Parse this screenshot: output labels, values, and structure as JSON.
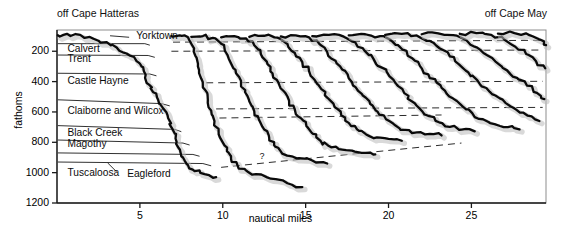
{
  "figure": {
    "site_left": "off Cape Hatteras",
    "site_right": "off Cape May"
  },
  "chart_data": {
    "type": "line",
    "title": "",
    "xlabel": "nautical miles",
    "ylabel": "fathoms",
    "xlim": [
      0,
      29.5
    ],
    "ylim": [
      1200,
      60
    ],
    "y_inverted": true,
    "grid": false,
    "xticks": [
      5,
      10,
      15,
      20,
      25
    ],
    "xtick_labels": [
      "5",
      "10",
      "15",
      "20",
      "25"
    ],
    "yticks": [
      200,
      400,
      600,
      800,
      1000,
      1200
    ],
    "ytick_labels": [
      "200",
      "400",
      "600",
      "800",
      "1000",
      "1200"
    ],
    "legend_position": "none",
    "annotations": [
      {
        "text": "off Cape Hatteras",
        "x": 0.2,
        "y": 40,
        "role": "site-left"
      },
      {
        "text": "off Cape May",
        "x": 27.5,
        "y": 40,
        "role": "site-right"
      },
      {
        "text": "?",
        "x": 12.4,
        "y": 905,
        "role": "uncertain-horizon-marker"
      }
    ],
    "stratigraphic_units": [
      {
        "name": "Yorktown",
        "label_x": 4.6,
        "label_y": 105,
        "top_fathoms": 90,
        "leader": true
      },
      {
        "name": "Calvert",
        "label_x": 0.45,
        "label_y": 195,
        "top_fathoms": 150
      },
      {
        "name": "Trent",
        "label_x": 0.45,
        "label_y": 255,
        "top_fathoms": 225
      },
      {
        "name": "Castle Hayne",
        "label_x": 0.45,
        "label_y": 400,
        "top_fathoms": 345
      },
      {
        "name": "Claiborne and Wilcox",
        "label_x": 0.45,
        "label_y": 600,
        "top_fathoms": 520
      },
      {
        "name": "Black Creek",
        "label_x": 0.45,
        "label_y": 745,
        "top_fathoms": 690
      },
      {
        "name": "Magothy",
        "label_x": 0.45,
        "label_y": 820,
        "top_fathoms": 785
      },
      {
        "name": "Tuscaloosa",
        "label_x": 0.45,
        "label_y": 1010,
        "top_fathoms": 870
      },
      {
        "name": "Eagleford",
        "label_x": 4.05,
        "label_y": 1015,
        "top_fathoms": 930,
        "leader": true
      }
    ],
    "horizon_dashed_lines": [
      {
        "name": "Yorktown base",
        "x_start": 7.0,
        "y_start": 140,
        "x_end": 29.3,
        "y_end": 128
      },
      {
        "name": "Calvert base",
        "x_start": 6.9,
        "y_start": 200,
        "x_end": 29.3,
        "y_end": 192
      },
      {
        "name": "Castle Hayne base",
        "x_start": 9.0,
        "y_start": 408,
        "x_end": 29.3,
        "y_end": 398
      },
      {
        "name": "Claiborne and Wilcox top",
        "x_start": 9.6,
        "y_start": 580,
        "x_end": 29.3,
        "y_end": 570
      },
      {
        "name": "Claiborne and Wilcox base",
        "x_start": 9.8,
        "y_start": 640,
        "x_end": 23.2,
        "y_end": 620
      },
      {
        "name": "uncertain deep horizon",
        "x_start": 9.9,
        "y_start": 965,
        "x_end": 24.4,
        "y_end": 805,
        "marker": "?"
      }
    ],
    "series": [
      {
        "name": "profile-trace-01",
        "points": [
          [
            0.05,
            95
          ],
          [
            0.6,
            85
          ],
          [
            1.4,
            92
          ],
          [
            2.2,
            118
          ],
          [
            3.0,
            140
          ],
          [
            3.6,
            175
          ],
          [
            4.2,
            215
          ],
          [
            4.8,
            265
          ],
          [
            5.1,
            300
          ],
          [
            5.35,
            355
          ],
          [
            5.55,
            420
          ],
          [
            5.8,
            470
          ],
          [
            6.1,
            520
          ],
          [
            6.4,
            575
          ],
          [
            6.7,
            640
          ],
          [
            6.95,
            710
          ],
          [
            7.15,
            775
          ],
          [
            7.35,
            840
          ],
          [
            7.6,
            900
          ],
          [
            7.9,
            950
          ],
          [
            8.3,
            990
          ],
          [
            8.9,
            1010
          ],
          [
            9.6,
            1030
          ]
        ]
      },
      {
        "name": "profile-trace-02",
        "points": [
          [
            6.9,
            100
          ],
          [
            7.4,
            95
          ],
          [
            7.9,
            108
          ],
          [
            8.15,
            160
          ],
          [
            8.35,
            230
          ],
          [
            8.5,
            300
          ],
          [
            8.7,
            380
          ],
          [
            8.9,
            450
          ],
          [
            9.1,
            520
          ],
          [
            9.3,
            590
          ],
          [
            9.5,
            660
          ],
          [
            9.75,
            730
          ],
          [
            10.0,
            800
          ],
          [
            10.25,
            860
          ],
          [
            10.5,
            910
          ],
          [
            10.9,
            955
          ],
          [
            11.4,
            985
          ],
          [
            12.0,
            1010
          ],
          [
            12.9,
            1040
          ],
          [
            13.9,
            1070
          ],
          [
            14.8,
            1095
          ]
        ]
      },
      {
        "name": "profile-trace-03",
        "points": [
          [
            8.1,
            105
          ],
          [
            8.8,
            100
          ],
          [
            9.4,
            112
          ],
          [
            9.9,
            150
          ],
          [
            10.2,
            210
          ],
          [
            10.5,
            280
          ],
          [
            10.8,
            345
          ],
          [
            11.1,
            410
          ],
          [
            11.35,
            470
          ],
          [
            11.6,
            530
          ],
          [
            11.9,
            595
          ],
          [
            12.2,
            655
          ],
          [
            12.5,
            715
          ],
          [
            12.8,
            770
          ],
          [
            13.1,
            820
          ],
          [
            13.5,
            860
          ],
          [
            14.0,
            890
          ],
          [
            14.6,
            905
          ],
          [
            15.4,
            920
          ],
          [
            16.3,
            940
          ]
        ]
      },
      {
        "name": "profile-trace-04",
        "points": [
          [
            9.9,
            108
          ],
          [
            10.7,
            100
          ],
          [
            11.4,
            115
          ],
          [
            11.9,
            160
          ],
          [
            12.3,
            220
          ],
          [
            12.7,
            285
          ],
          [
            13.0,
            345
          ],
          [
            13.35,
            405
          ],
          [
            13.7,
            465
          ],
          [
            14.0,
            525
          ],
          [
            14.35,
            585
          ],
          [
            14.7,
            640
          ],
          [
            15.05,
            695
          ],
          [
            15.45,
            745
          ],
          [
            15.9,
            790
          ],
          [
            16.4,
            825
          ],
          [
            17.0,
            845
          ],
          [
            17.8,
            855
          ],
          [
            18.6,
            870
          ],
          [
            19.2,
            880
          ]
        ]
      },
      {
        "name": "profile-trace-05",
        "points": [
          [
            11.6,
            105
          ],
          [
            12.5,
            98
          ],
          [
            13.3,
            110
          ],
          [
            13.9,
            152
          ],
          [
            14.35,
            212
          ],
          [
            14.8,
            272
          ],
          [
            15.2,
            330
          ],
          [
            15.55,
            390
          ],
          [
            15.95,
            450
          ],
          [
            16.35,
            510
          ],
          [
            16.75,
            568
          ],
          [
            17.15,
            622
          ],
          [
            17.6,
            672
          ],
          [
            18.1,
            715
          ],
          [
            18.65,
            748
          ],
          [
            19.3,
            768
          ],
          [
            20.0,
            778
          ],
          [
            20.8,
            790
          ]
        ]
      },
      {
        "name": "profile-trace-06",
        "points": [
          [
            13.5,
            102
          ],
          [
            14.4,
            95
          ],
          [
            15.2,
            108
          ],
          [
            15.8,
            148
          ],
          [
            16.3,
            205
          ],
          [
            16.8,
            262
          ],
          [
            17.2,
            320
          ],
          [
            17.6,
            378
          ],
          [
            18.0,
            435
          ],
          [
            18.45,
            492
          ],
          [
            18.9,
            548
          ],
          [
            19.35,
            600
          ],
          [
            19.85,
            648
          ],
          [
            20.4,
            688
          ],
          [
            21.0,
            718
          ],
          [
            21.7,
            735
          ],
          [
            22.5,
            745
          ],
          [
            23.2,
            755
          ]
        ]
      },
      {
        "name": "profile-trace-07",
        "points": [
          [
            15.4,
            100
          ],
          [
            16.4,
            92
          ],
          [
            17.3,
            104
          ],
          [
            18.0,
            142
          ],
          [
            18.55,
            196
          ],
          [
            19.1,
            252
          ],
          [
            19.6,
            308
          ],
          [
            20.05,
            364
          ],
          [
            20.5,
            420
          ],
          [
            20.95,
            476
          ],
          [
            21.4,
            530
          ],
          [
            21.9,
            580
          ],
          [
            22.45,
            628
          ],
          [
            23.05,
            668
          ],
          [
            23.7,
            698
          ],
          [
            24.4,
            716
          ],
          [
            25.2,
            728
          ]
        ]
      },
      {
        "name": "profile-trace-08",
        "points": [
          [
            17.6,
            96
          ],
          [
            18.6,
            88
          ],
          [
            19.5,
            100
          ],
          [
            20.25,
            138
          ],
          [
            20.85,
            190
          ],
          [
            21.4,
            244
          ],
          [
            21.9,
            298
          ],
          [
            22.4,
            352
          ],
          [
            22.9,
            406
          ],
          [
            23.4,
            460
          ],
          [
            23.9,
            512
          ],
          [
            24.45,
            562
          ],
          [
            25.05,
            608
          ],
          [
            25.7,
            648
          ],
          [
            26.4,
            680
          ],
          [
            27.2,
            700
          ],
          [
            27.9,
            715
          ]
        ]
      },
      {
        "name": "profile-trace-09",
        "points": [
          [
            19.8,
            92
          ],
          [
            20.8,
            85
          ],
          [
            21.7,
            96
          ],
          [
            22.5,
            132
          ],
          [
            23.1,
            182
          ],
          [
            23.7,
            234
          ],
          [
            24.25,
            286
          ],
          [
            24.8,
            338
          ],
          [
            25.35,
            390
          ],
          [
            25.9,
            442
          ],
          [
            26.45,
            492
          ],
          [
            27.05,
            540
          ],
          [
            27.7,
            585
          ],
          [
            28.4,
            625
          ],
          [
            29.1,
            660
          ]
        ]
      },
      {
        "name": "profile-trace-10",
        "points": [
          [
            22.0,
            88
          ],
          [
            23.0,
            82
          ],
          [
            23.9,
            94
          ],
          [
            24.7,
            128
          ],
          [
            25.35,
            176
          ],
          [
            25.95,
            226
          ],
          [
            26.55,
            276
          ],
          [
            27.15,
            326
          ],
          [
            27.75,
            376
          ],
          [
            28.35,
            426
          ],
          [
            28.95,
            474
          ],
          [
            29.4,
            515
          ]
        ]
      },
      {
        "name": "profile-trace-11",
        "points": [
          [
            24.3,
            85
          ],
          [
            25.3,
            80
          ],
          [
            26.2,
            92
          ],
          [
            27.0,
            124
          ],
          [
            27.65,
            170
          ],
          [
            28.3,
            218
          ],
          [
            28.9,
            266
          ],
          [
            29.45,
            312
          ]
        ]
      },
      {
        "name": "profile-trace-12",
        "points": [
          [
            26.6,
            84
          ],
          [
            27.6,
            80
          ],
          [
            28.5,
            94
          ],
          [
            29.2,
            126
          ],
          [
            29.5,
            160
          ]
        ]
      }
    ],
    "unit_wedge_lines": [
      {
        "name": "Yorktown-base-wedge",
        "points": [
          [
            0.05,
            150
          ],
          [
            5.3,
            150
          ],
          [
            5.6,
            160
          ]
        ]
      },
      {
        "name": "Calvert-base-wedge",
        "points": [
          [
            0.05,
            225
          ],
          [
            5.5,
            228
          ],
          [
            5.9,
            240
          ]
        ]
      },
      {
        "name": "Trent-base-wedge",
        "points": [
          [
            0.05,
            345
          ],
          [
            5.6,
            350
          ],
          [
            6.0,
            362
          ]
        ]
      },
      {
        "name": "CastleHayne-base",
        "points": [
          [
            0.05,
            520
          ],
          [
            6.3,
            545
          ],
          [
            6.8,
            560
          ]
        ]
      },
      {
        "name": "Claiborne-base",
        "points": [
          [
            0.05,
            690
          ],
          [
            7.1,
            715
          ],
          [
            7.5,
            730
          ]
        ]
      },
      {
        "name": "BlackCreek-base",
        "points": [
          [
            0.05,
            785
          ],
          [
            7.6,
            805
          ],
          [
            8.0,
            818
          ]
        ]
      },
      {
        "name": "Magothy-base",
        "points": [
          [
            0.05,
            870
          ],
          [
            8.2,
            880
          ],
          [
            8.6,
            892
          ]
        ]
      },
      {
        "name": "Eagleford-base",
        "points": [
          [
            0.05,
            930
          ],
          [
            8.8,
            940
          ],
          [
            9.3,
            955
          ]
        ]
      },
      {
        "name": "Eagleford-leader",
        "points": [
          [
            3.6,
            995
          ],
          [
            3.05,
            935
          ]
        ]
      },
      {
        "name": "Yorktown-leader",
        "points": [
          [
            4.35,
            108
          ],
          [
            3.2,
            98
          ]
        ]
      }
    ]
  }
}
